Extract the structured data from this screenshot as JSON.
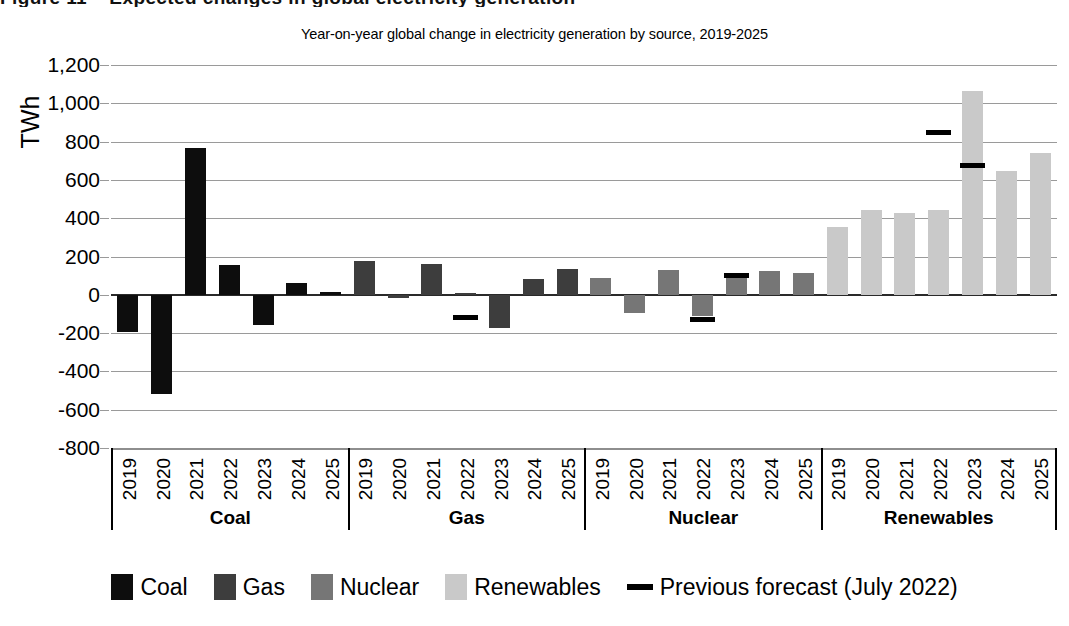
{
  "top_cut_text": "Figure 11 – Expected changes in global electricity generation",
  "chart_data": {
    "type": "bar",
    "title": "Year-on-year global change in electricity generation by source, 2019-2025",
    "xlabel": "",
    "ylabel": "TWh",
    "ylim": [
      -800,
      1200
    ],
    "ytick_step": 200,
    "grid": true,
    "legend_position": "bottom",
    "ytick_labels": [
      "1,200",
      "1,000",
      "800",
      "600",
      "400",
      "200",
      "0",
      "-200",
      "-400",
      "-600",
      "-800"
    ],
    "ytick_values": [
      1200,
      1000,
      800,
      600,
      400,
      200,
      0,
      -200,
      -400,
      -600,
      -800
    ],
    "categories": [
      "2019",
      "2020",
      "2021",
      "2022",
      "2023",
      "2024",
      "2025"
    ],
    "groups": [
      {
        "name": "Coal",
        "color": "#0d0d0d",
        "values": [
          -195,
          -520,
          765,
          155,
          -160,
          60,
          15
        ],
        "forecast": [
          null,
          null,
          null,
          null,
          null,
          null,
          null
        ]
      },
      {
        "name": "Gas",
        "color": "#3d3d3d",
        "values": [
          178,
          -15,
          160,
          12,
          -175,
          85,
          135
        ],
        "forecast": [
          null,
          null,
          null,
          -120,
          null,
          null,
          null
        ]
      },
      {
        "name": "Nuclear",
        "color": "#767676",
        "values": [
          90,
          -95,
          130,
          -110,
          95,
          125,
          112
        ],
        "forecast": [
          null,
          null,
          null,
          -130,
          102,
          null,
          null
        ]
      },
      {
        "name": "Renewables",
        "color": "#c9c9c9",
        "values": [
          355,
          445,
          425,
          445,
          1065,
          645,
          740
        ],
        "forecast": [
          null,
          null,
          null,
          845,
          675,
          null,
          null
        ]
      }
    ],
    "legend": [
      {
        "label": "Coal",
        "color": "#0d0d0d",
        "marker": "swatch"
      },
      {
        "label": "Gas",
        "color": "#3d3d3d",
        "marker": "swatch"
      },
      {
        "label": "Nuclear",
        "color": "#767676",
        "marker": "swatch"
      },
      {
        "label": "Renewables",
        "color": "#c9c9c9",
        "marker": "swatch"
      },
      {
        "label": "Previous forecast (July 2022)",
        "color": "#000000",
        "marker": "dash"
      }
    ]
  }
}
